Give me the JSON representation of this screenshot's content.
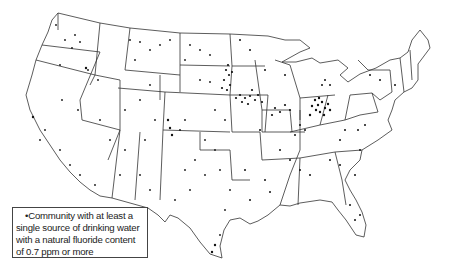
{
  "map": {
    "title": "",
    "region": "Contiguous United States",
    "symbol": "dot",
    "colors": {
      "outline": "#333333",
      "dots": "#111111",
      "background": "#ffffff"
    }
  },
  "legend": {
    "symbol": "•",
    "lines": [
      "Community with at least a",
      "single source of drinking water",
      "with a natural fluoride content",
      "of 0.7 ppm or more"
    ]
  }
}
